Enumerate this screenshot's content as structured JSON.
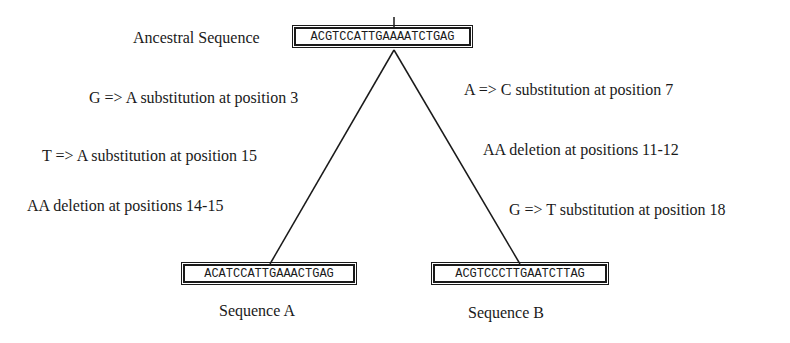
{
  "diagram": {
    "ancestor": {
      "label": "Ancestral Sequence",
      "sequence": "ACGTCCATTGAAAATCTGAG"
    },
    "left_branch": {
      "mutations": [
        "G => A substitution at position 3",
        "T => A substitution at position 15",
        "AA deletion at positions 14-15"
      ],
      "descendant": {
        "label": "Sequence A",
        "sequence": "ACATCCATTGAAACTGAG"
      }
    },
    "right_branch": {
      "mutations": [
        "A => C substitution at position 7",
        "AA deletion at positions 11-12",
        "G => T substitution at position 18"
      ],
      "descendant": {
        "label": "Sequence B",
        "sequence": "ACGTCCCTTGAATCTTAG"
      }
    },
    "colors": {
      "ink": "#1a1a1a",
      "background": "#ffffff"
    }
  }
}
